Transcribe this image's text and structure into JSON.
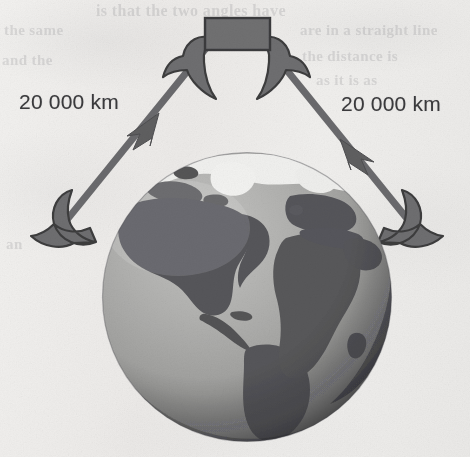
{
  "figure": {
    "name": "satellite-altitude-diagram",
    "background_color": "#edecea"
  },
  "labels": {
    "left_distance": "20 000 km",
    "right_distance": "20 000 km"
  },
  "satellite": {
    "name": "satellite",
    "body_color": "#6e6e70",
    "outline_color": "#3c3c3e",
    "panel_left_name": "satellite-wing-left",
    "panel_right_name": "satellite-wing-right"
  },
  "paths": {
    "left": {
      "name": "signal-path-left",
      "color": "#6b6b6d",
      "arrow_direction": "up-right",
      "terminator": "ground-antenna-left"
    },
    "right": {
      "name": "signal-path-right",
      "color": "#6b6b6d",
      "arrow_direction": "down-right",
      "terminator": "ground-antenna-right"
    }
  },
  "globe": {
    "name": "earth-globe",
    "view": "Atlantic",
    "ocean_color": "#a9a9a7",
    "land_color": "#58585a",
    "ice_color": "#f2f2f0",
    "shadow_color": "#3f3f41",
    "center_x": 247,
    "center_y": 297,
    "diameter": 289
  },
  "bleed_through_text": [
    "is that the two angles have",
    "are in a straight line",
    "the distance is",
    "as it is as",
    "the same",
    "and the",
    "an"
  ]
}
